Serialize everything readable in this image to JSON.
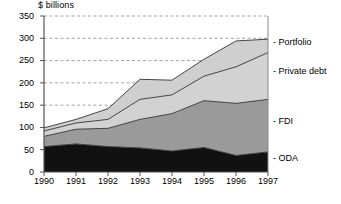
{
  "chart_data": {
    "type": "area",
    "stacked": true,
    "title": "$ billions",
    "xlabel": "",
    "ylabel": "$ billions",
    "ylim": [
      0,
      350
    ],
    "ytick_step": 50,
    "yticks": [
      0,
      50,
      100,
      150,
      200,
      250,
      300,
      350
    ],
    "grid": "horizontal-dashed",
    "legend_position": "right-inline",
    "categories": [
      "1990",
      "1991",
      "1992",
      "1993",
      "1994",
      "1995",
      "1996",
      "1997"
    ],
    "series": [
      {
        "name": "ODA",
        "color": "#111111",
        "values": [
          57,
          63,
          57,
          54,
          47,
          55,
          37,
          45
        ]
      },
      {
        "name": "FDI",
        "color": "#9a9a9a",
        "values": [
          23,
          33,
          41,
          64,
          84,
          105,
          117,
          118
        ]
      },
      {
        "name": "Private debt",
        "color": "#d2d2d2",
        "values": [
          12,
          14,
          20,
          45,
          42,
          55,
          82,
          105
        ]
      },
      {
        "name": "Portfolio",
        "color": "#cfcfcf",
        "values": [
          7,
          8,
          24,
          45,
          33,
          38,
          58,
          30
        ]
      }
    ],
    "totals": [
      99,
      118,
      142,
      208,
      206,
      253,
      294,
      298
    ],
    "annotations": [
      {
        "text": "- Portfolio",
        "value_at_1997": 298
      },
      {
        "text": "- Private debt",
        "value_at_1997": 268
      },
      {
        "text": "- FDI",
        "value_at_1997": 163
      },
      {
        "text": "- ODA",
        "value_at_1997": 45
      }
    ]
  },
  "labels": {
    "axis_title": "$ billions",
    "y0": "0",
    "y1": "50",
    "y2": "100",
    "y3": "150",
    "y4": "200",
    "y5": "250",
    "y6": "300",
    "y7": "350",
    "x0": "1990",
    "x1": "1991",
    "x2": "1992",
    "x3": "1993",
    "x4": "1994",
    "x5": "1995",
    "x6": "1996",
    "x7": "1997",
    "legend_portfolio": "- Portfolio",
    "legend_private_debt": "- Private debt",
    "legend_fdi": "- FDI",
    "legend_oda": "- ODA"
  }
}
